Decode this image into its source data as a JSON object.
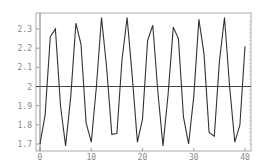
{
  "chart_data": {
    "type": "line",
    "title": "",
    "xlabel": "",
    "ylabel": "",
    "xlim": [
      0,
      40
    ],
    "ylim": [
      1.68,
      2.38
    ],
    "grid": false,
    "legend": null,
    "x_ticks": [
      0,
      10,
      20,
      30,
      40
    ],
    "x_tick_labels": [
      "0",
      "10",
      "20",
      "30",
      "40"
    ],
    "y_ticks": [
      1.7,
      1.8,
      1.9,
      2.0,
      2.1,
      2.2,
      2.3
    ],
    "y_tick_labels": [
      "1.7",
      "1.8",
      "1.9",
      "2",
      "2.1",
      "2.2",
      "2.3"
    ],
    "reference_line": {
      "y": 2.0
    },
    "series": [
      {
        "name": "series",
        "x": [
          0,
          1,
          2,
          3,
          4,
          5,
          6,
          7,
          8,
          9,
          10,
          11,
          12,
          13,
          14,
          15,
          16,
          17,
          18,
          19,
          20,
          21,
          22,
          23,
          24,
          25,
          26,
          27,
          28,
          29,
          30,
          31,
          32,
          33,
          34,
          35,
          36,
          37,
          38,
          39,
          40
        ],
        "values": [
          1.7,
          1.85,
          2.26,
          2.3,
          1.9,
          1.69,
          1.95,
          2.33,
          2.22,
          1.81,
          1.71,
          2.0,
          2.36,
          2.1,
          1.75,
          1.755,
          2.14,
          2.36,
          2.05,
          1.71,
          1.83,
          2.24,
          2.32,
          1.97,
          1.69,
          1.96,
          2.31,
          2.25,
          1.84,
          1.7,
          1.95,
          2.35,
          2.17,
          1.76,
          1.74,
          2.13,
          2.36,
          2.0,
          1.71,
          1.8,
          2.21
        ]
      }
    ]
  },
  "colors": {
    "line": "#333333",
    "frame": "#999999",
    "axis": "#555555",
    "tick_label": "#888888"
  }
}
